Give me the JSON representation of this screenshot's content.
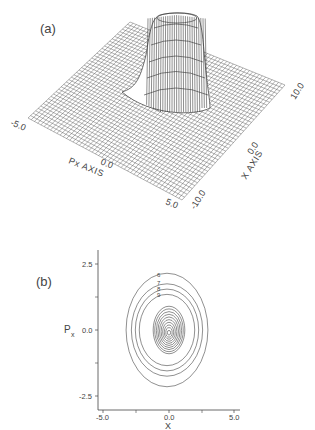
{
  "chart_data": [
    {
      "type": "surface3d",
      "panel_label": "(a)",
      "title": "",
      "xlabel": "X AXIS",
      "ylabel": "Px AXIS",
      "x_ticks": [
        "-10.0",
        "0.0",
        "10.0"
      ],
      "px_ticks": [
        "-5.0",
        "0.0",
        "5.0"
      ],
      "x_range": [
        -10.0,
        10.0
      ],
      "px_range": [
        -5.0,
        5.0
      ],
      "description": "Wireframe surface of a phase-space distribution with a single peak near x=0, px=0; flat-topped crater-like rim at the summit",
      "grid": true
    },
    {
      "type": "contour",
      "panel_label": "(b)",
      "title": "",
      "xlabel": "X",
      "ylabel": "Px",
      "x_ticks": [
        "-5.0",
        "0.0",
        "5.0"
      ],
      "y_ticks": [
        "2.5",
        "0.0",
        "-2.5"
      ],
      "xlim": [
        -5.0,
        5.0
      ],
      "ylim": [
        -2.5,
        2.5
      ],
      "center": [
        0.0,
        0.0
      ],
      "contour_labels": [
        "6",
        "7",
        "8",
        "9",
        "8",
        "6",
        "5",
        "4",
        "3",
        "2",
        "1"
      ],
      "outer_contours": [
        {
          "label": "6",
          "half_width_x": 3.1,
          "half_height_px": 2.15
        },
        {
          "label": "7",
          "half_width_x": 2.7,
          "half_height_px": 1.75
        },
        {
          "label": "8",
          "half_width_x": 2.4,
          "half_height_px": 1.55
        },
        {
          "label": "9",
          "half_width_x": 2.1,
          "half_height_px": 1.35
        }
      ],
      "inner_contour_count": 10,
      "inner_half_width_x": 1.2,
      "inner_half_height_px": 0.9
    }
  ],
  "panel_a": {
    "label": "(a)",
    "axis_px_label": "Px AXIS",
    "axis_x_label": "X AXIS",
    "tick_px_min": "-5.0",
    "tick_px_mid": "0.0",
    "tick_px_max": "5.0",
    "tick_x_min": "-10.0",
    "tick_x_mid": "0.0",
    "tick_x_max": "10.0"
  },
  "panel_b": {
    "label": "(b)",
    "ylabel_main": "P",
    "ylabel_sub": "x",
    "xlabel": "X",
    "y_tick_top": "2.5",
    "y_tick_mid": "0.0",
    "y_tick_bot": "-2.5",
    "x_tick_left": "-5.0",
    "x_tick_mid": "0.0",
    "x_tick_right": "5.0",
    "contour_label_6": "6",
    "contour_label_7": "7",
    "contour_label_8": "8",
    "contour_label_9": "9"
  }
}
